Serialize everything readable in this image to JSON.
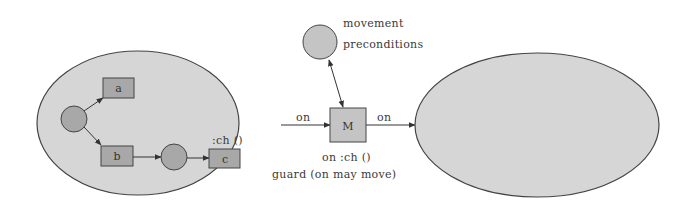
{
  "diagram": {
    "colors": {
      "state_fill": "#d6d6d6",
      "node_fill": "#a8a8a8",
      "stroke": "#444444",
      "text": "#3a3a3a"
    },
    "left_state": {
      "nodes": {
        "a": "a",
        "b": "b",
        "c": "c"
      },
      "c_event_label": ":ch ()"
    },
    "center": {
      "m_label": "M",
      "precondition_label_line1": "movement",
      "precondition_label_line2": "preconditions",
      "incoming_edge_label": "on",
      "outgoing_edge_label": "on",
      "event_label": "on :ch ()",
      "guard_label": "guard (on may move)"
    },
    "right_state": {}
  }
}
